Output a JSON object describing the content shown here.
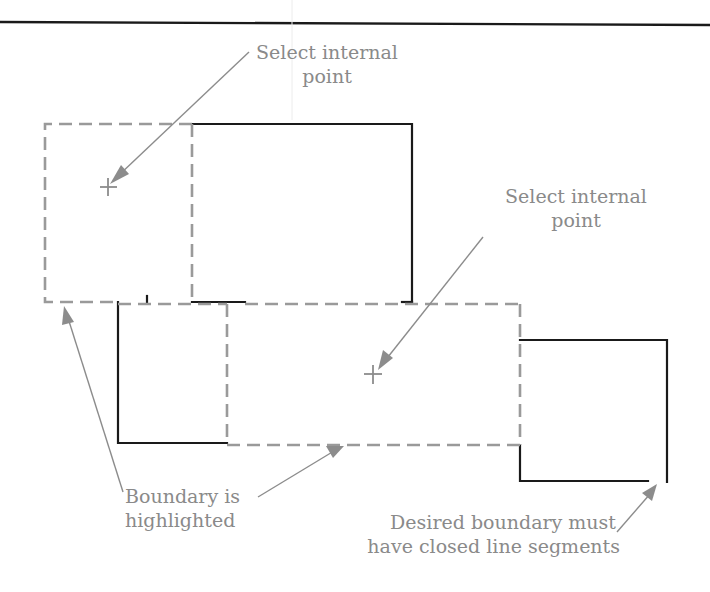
{
  "figure": {
    "type": "boundary-hatch-diagram",
    "labels": {
      "select_point_1_line1": "Select internal",
      "select_point_1_line2": "point",
      "select_point_2_line1": "Select internal",
      "select_point_2_line2": "point",
      "boundary_line1": "Boundary is",
      "boundary_line2": "highlighted",
      "desired_line1": "Desired boundary must",
      "desired_line2": "have closed line segments"
    },
    "colors": {
      "object_line": "#1a1a1a",
      "highlighted_boundary": "#9a9a9a",
      "annotation": "#8a8a8a"
    },
    "shapes": [
      {
        "name": "upper-left-region",
        "style": "highlighted",
        "x1": 45,
        "y1": 124,
        "x2": 192,
        "y2": 302
      },
      {
        "name": "upper-right-box",
        "style": "solid",
        "x1": 192,
        "y1": 124,
        "x2": 412,
        "y2": 302
      },
      {
        "name": "lower-left-box",
        "style": "solid",
        "x1": 118,
        "y1": 302,
        "x2": 227,
        "y2": 443
      },
      {
        "name": "center-region",
        "style": "highlighted",
        "x1": 227,
        "y1": 304,
        "x2": 520,
        "y2": 445
      },
      {
        "name": "open-right-box",
        "style": "solid-open",
        "x1": 520,
        "y1": 340,
        "x2": 667,
        "y2": 482
      }
    ],
    "pick_points": [
      {
        "x": 108,
        "y": 187
      },
      {
        "x": 373,
        "y": 375
      }
    ]
  }
}
